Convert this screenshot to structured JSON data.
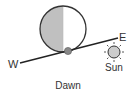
{
  "diagram": {
    "caption": "Dawn",
    "labels": {
      "west": "W",
      "east": "E",
      "sun": "Sun"
    },
    "moon": {
      "phase": "last-quarter",
      "lit_side": "left",
      "shadow_color": "#c0c0c0",
      "lit_color": "#ffffff"
    },
    "colors": {
      "stroke": "#333333",
      "observer_dot": "#888888",
      "sun_fill": "#cccccc"
    }
  }
}
